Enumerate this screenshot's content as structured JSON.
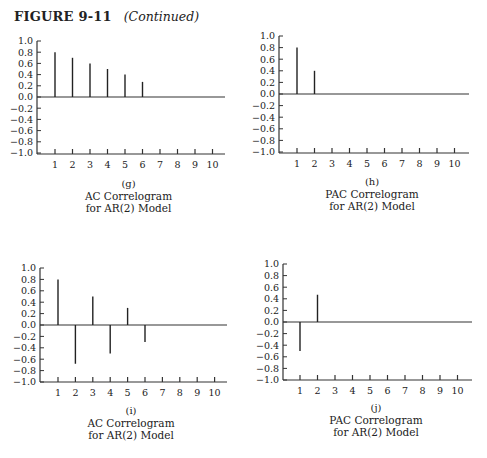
{
  "figure": {
    "number_label": "FIGURE 9-11",
    "continued_label": "(Continued)"
  },
  "chart_data": [
    {
      "id": "g",
      "type": "bar",
      "title": "AC Correlogram for AR(2) Model",
      "caption_letter": "(g)",
      "caption_line1": "AC Correlogram",
      "caption_line2": "for AR(2) Model",
      "categories": [
        1,
        2,
        3,
        4,
        5,
        6,
        7,
        8,
        9,
        10
      ],
      "values": [
        0.8,
        0.7,
        0.6,
        0.5,
        0.4,
        0.27,
        0,
        0,
        0,
        0
      ],
      "xlabel": "",
      "ylabel": "",
      "ylim": [
        -1.0,
        1.0
      ],
      "yticks": [
        "1.0",
        "0.8",
        "0.6",
        "0.4",
        "0.2",
        "0.0",
        "−0.2",
        "−0.4",
        "−0.6",
        "−0.8",
        "−1.0"
      ],
      "grid": false,
      "layout": {
        "left": 37,
        "top": 41,
        "zero": 97,
        "bottom": 154,
        "right": 225,
        "tick1": 55,
        "tickStep": 17.5,
        "capX": 32,
        "capY": 178
      }
    },
    {
      "id": "h",
      "type": "bar",
      "title": "PAC Correlogram for AR(2) Model",
      "caption_letter": "(h)",
      "caption_line1": "PAC Correlogram",
      "caption_line2": "for AR(2) Model",
      "categories": [
        1,
        2,
        3,
        4,
        5,
        6,
        7,
        8,
        9,
        10
      ],
      "values": [
        0.8,
        0.4,
        0,
        0,
        0,
        0,
        0,
        0,
        0,
        0
      ],
      "xlabel": "",
      "ylabel": "",
      "ylim": [
        -1.0,
        1.0
      ],
      "yticks": [
        "1.0",
        "0.8",
        "0.6",
        "0.4",
        "0.2",
        "0.0",
        "−0.2",
        "−0.4",
        "−0.6",
        "−0.8",
        "−1.0"
      ],
      "grid": false,
      "layout": {
        "left": 279,
        "top": 36,
        "zero": 94,
        "bottom": 153,
        "right": 469,
        "tick1": 297,
        "tickStep": 17.5,
        "capX": 275,
        "capY": 176
      }
    },
    {
      "id": "i",
      "type": "bar",
      "title": "AC Correlogram for AR(2) Model",
      "caption_letter": "(i)",
      "caption_line1": "AC Correlogram",
      "caption_line2": "for AR(2) Model",
      "categories": [
        1,
        2,
        3,
        4,
        5,
        6,
        7,
        8,
        9,
        10
      ],
      "values": [
        0.8,
        -0.68,
        0.5,
        -0.5,
        0.3,
        -0.3,
        0,
        0,
        0,
        0
      ],
      "xlabel": "",
      "ylabel": "",
      "ylim": [
        -1.0,
        1.0
      ],
      "yticks": [
        "1.0",
        "0.8",
        "0.6",
        "0.4",
        "0.2",
        "0.0",
        "−0.2",
        "−0.4",
        "−0.6",
        "−0.8",
        "−1.0"
      ],
      "grid": false,
      "layout": {
        "left": 40,
        "top": 268,
        "zero": 325,
        "bottom": 382,
        "right": 227,
        "tick1": 58,
        "tickStep": 17.4,
        "capX": 35,
        "capY": 405
      }
    },
    {
      "id": "j",
      "type": "bar",
      "title": "PAC Correlogram for AR(2) Model",
      "caption_letter": "(j)",
      "caption_line1": "PAC Correlogram",
      "caption_line2": "for AR(2) Model",
      "categories": [
        1,
        2,
        3,
        4,
        5,
        6,
        7,
        8,
        9,
        10
      ],
      "values": [
        -0.5,
        0.47,
        0,
        0,
        0,
        0,
        0,
        0,
        0,
        0
      ],
      "xlabel": "",
      "ylabel": "",
      "ylim": [
        -1.0,
        1.0
      ],
      "yticks": [
        "1.0",
        "0.8",
        "0.6",
        "0.4",
        "0.2",
        "0.0",
        "−0.2",
        "−0.4",
        "−0.6",
        "−0.8",
        "−1.0"
      ],
      "grid": false,
      "layout": {
        "left": 283,
        "top": 264,
        "zero": 322,
        "bottom": 380,
        "right": 472,
        "tick1": 300,
        "tickStep": 17.5,
        "capX": 280,
        "capY": 402
      }
    }
  ]
}
